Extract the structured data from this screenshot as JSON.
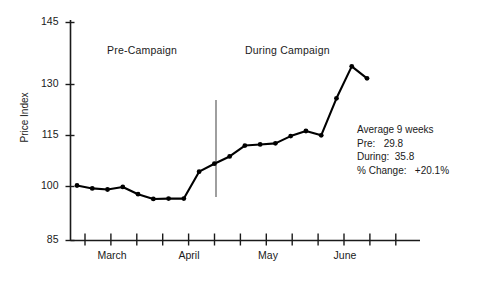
{
  "chart_data": {
    "type": "line",
    "title": "",
    "xlabel": "",
    "ylabel": "Price Index",
    "ylim": [
      85,
      145
    ],
    "yticks": [
      85,
      100,
      115,
      130,
      145
    ],
    "ytick_labels": [
      "85",
      "100",
      "115",
      "130",
      "145"
    ],
    "grid": false,
    "legend": "none",
    "x_axis_type": "weeks",
    "xtick_labels": [
      "March",
      "April",
      "May",
      "June"
    ],
    "x_week_ticks": 13,
    "series": [
      {
        "name": "Price Index",
        "marker": "filled-circle",
        "color": "#000000",
        "x": [
          1,
          2,
          3,
          4,
          5,
          6,
          7,
          8,
          9,
          10,
          11,
          12,
          13,
          14,
          15,
          16,
          17,
          18,
          19
        ],
        "values": [
          100.0,
          99.2,
          98.9,
          99.6,
          97.6,
          96.3,
          96.4,
          96.4,
          103.8,
          106.0,
          108.0,
          111.0,
          111.3,
          111.6,
          113.6,
          115.0,
          113.8,
          124.0,
          132.8
        ],
        "values_note": "final point",
        "last_value": 129.5
      }
    ],
    "annotations": [
      {
        "name": "pre-campaign-label",
        "text": "Pre-Campaign",
        "x_px": 107,
        "y_px": 44
      },
      {
        "name": "during-campaign-label",
        "text": "During Campaign",
        "x_px": 245,
        "y_px": 44
      },
      {
        "name": "campaign-divider",
        "type": "vline",
        "x_px": 216,
        "y_top_px": 100,
        "y_bottom_px": 197
      }
    ]
  },
  "axes": {
    "y_title": "Price Index",
    "y_ticks": [
      {
        "label": "145",
        "y_px": 22
      },
      {
        "label": "130",
        "y_px": 84
      },
      {
        "label": "115",
        "y_px": 135
      },
      {
        "label": "100",
        "y_px": 186
      },
      {
        "label": "85",
        "y_px": 240
      }
    ],
    "x_ticks": [
      {
        "label": "March",
        "x_px": 112
      },
      {
        "label": "April",
        "x_px": 189
      },
      {
        "label": "May",
        "x_px": 268
      },
      {
        "label": "June",
        "x_px": 345
      }
    ]
  },
  "annotations": {
    "pre_campaign": "Pre-Campaign",
    "during_campaign": "During Campaign"
  },
  "stats": {
    "title": "Average 9 weeks",
    "pre_key": "Pre:",
    "pre_value": "29.8",
    "during_key": "During:",
    "during_value": "35.8",
    "change_key": "% Change:",
    "change_value": "+20.1%"
  },
  "colors": {
    "line": "#000000",
    "axis": "#1a1a1a",
    "divider": "#6b6b6b",
    "background": "#ffffff"
  }
}
